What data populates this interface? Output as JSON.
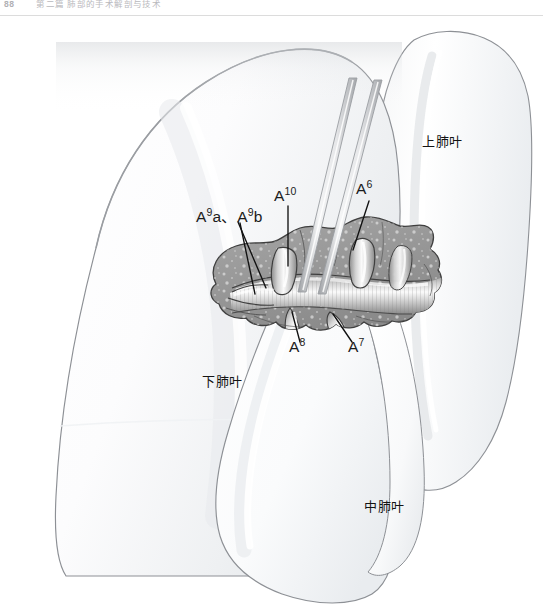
{
  "page": {
    "folio": "88",
    "running_head": "第二篇 肺部的手术解剖与技术",
    "width": 543,
    "height": 610
  },
  "figure": {
    "name": "right-lung-hilum-pulmonary-artery-branches",
    "background_color": "#ffffff",
    "lung_fill_light": "#fbfbfb",
    "lung_fill_shade": "#eceef0",
    "lung_outline_color": "#8d9095",
    "tissue_fill": "#9a9a9a",
    "tissue_outline": "#4a4a4a",
    "vessel_highlight": "#f2f2f2",
    "instrument_color": "#b5b7ba",
    "leader_color": "#111111",
    "label_color": "#1b1b1b"
  },
  "labels": {
    "artery": [
      {
        "id": "a9a-a9b",
        "text": "A9a、A9b",
        "base": "A",
        "sup1": "9",
        "mid": "a、A",
        "sup2": "9",
        "tail": "b",
        "x": 196,
        "y": 201
      },
      {
        "id": "a10",
        "text": "A10",
        "base": "A",
        "sup": "10",
        "x": 274,
        "y": 180
      },
      {
        "id": "a6",
        "text": "A6",
        "base": "A",
        "sup": "6",
        "x": 356,
        "y": 173
      },
      {
        "id": "a8",
        "text": "A8",
        "base": "A",
        "sup": "8",
        "x": 290,
        "y": 331
      },
      {
        "id": "a7",
        "text": "A7",
        "base": "A",
        "sup": "7",
        "x": 349,
        "y": 331
      }
    ],
    "lobes": [
      {
        "id": "upper-lobe",
        "text": "上肺叶",
        "x": 422,
        "y": 125
      },
      {
        "id": "lower-lobe",
        "text": "下肺叶",
        "x": 202,
        "y": 365
      },
      {
        "id": "middle-lobe",
        "text": "中肺叶",
        "x": 364,
        "y": 490
      }
    ]
  }
}
